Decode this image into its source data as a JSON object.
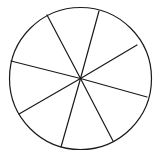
{
  "figure": {
    "name": "circle-divided-into-sectors",
    "background_color": "#ffffff",
    "stroke_color": "#1a1a1a",
    "fill_color": "#ffffff",
    "stroke_width": 1.2,
    "canvas": {
      "width": 162,
      "height": 157
    },
    "circle": {
      "cx": 80.5,
      "cy": 78.5,
      "r": 71
    },
    "sector_count": 8,
    "radii": [
      {
        "name": "radius-up-right",
        "angle_deg": -75,
        "endpoint": {
          "x": 99,
          "y": 11
        }
      },
      {
        "name": "radius-right-upper",
        "angle_deg": -28,
        "endpoint": {
          "x": 137,
          "y": 45
        }
      },
      {
        "name": "radius-right-lower",
        "angle_deg": 15,
        "endpoint": {
          "x": 147,
          "y": 97
        }
      },
      {
        "name": "radius-down-right",
        "angle_deg": 63,
        "endpoint": {
          "x": 113,
          "y": 141
        }
      },
      {
        "name": "radius-down-left",
        "angle_deg": 106,
        "endpoint": {
          "x": 61,
          "y": 147
        }
      },
      {
        "name": "radius-left-lower",
        "angle_deg": 150,
        "endpoint": {
          "x": 19,
          "y": 114
        }
      },
      {
        "name": "radius-left-upper",
        "angle_deg": 194,
        "endpoint": {
          "x": 11,
          "y": 61
        }
      },
      {
        "name": "radius-up-left",
        "angle_deg": 242,
        "endpoint": {
          "x": 47,
          "y": 15
        }
      }
    ]
  }
}
